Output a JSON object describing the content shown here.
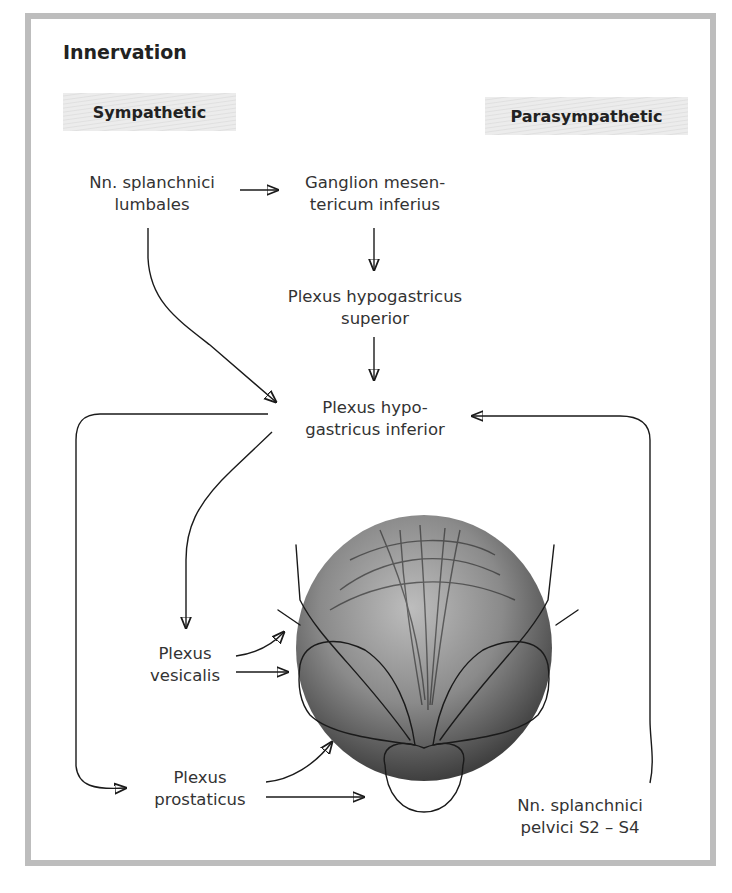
{
  "title": "Innervation",
  "columns": {
    "sympathetic": "Sympathetic",
    "parasympathetic": "Parasympathetic"
  },
  "nodes": {
    "nn_splanchnici_lumbales": [
      "Nn. splanchnici",
      "lumbales"
    ],
    "ganglion_mesentericum_inferius": [
      "Ganglion mesen-",
      "tericum inferius"
    ],
    "plexus_hypogastricus_superior": [
      "Plexus hypogastricus",
      "superior"
    ],
    "plexus_hypogastricus_inferior": [
      "Plexus hypo-",
      "gastricus inferior"
    ],
    "plexus_vesicalis": [
      "Plexus",
      "vesicalis"
    ],
    "plexus_prostaticus": [
      "Plexus",
      "prostaticus"
    ],
    "nn_splanchnici_pelvici": [
      "Nn. splanchnici",
      "pelvici S2 – S4"
    ]
  },
  "edges": [
    {
      "from": "nn_splanchnici_lumbales",
      "to": "ganglion_mesentericum_inferius"
    },
    {
      "from": "nn_splanchnici_lumbales",
      "to": "plexus_hypogastricus_inferior"
    },
    {
      "from": "ganglion_mesentericum_inferius",
      "to": "plexus_hypogastricus_superior"
    },
    {
      "from": "plexus_hypogastricus_superior",
      "to": "plexus_hypogastricus_inferior"
    },
    {
      "from": "nn_splanchnici_pelvici",
      "to": "plexus_hypogastricus_inferior"
    },
    {
      "from": "plexus_hypogastricus_inferior",
      "to": "plexus_vesicalis"
    },
    {
      "from": "plexus_hypogastricus_inferior",
      "to": "plexus_prostaticus"
    },
    {
      "from": "plexus_vesicalis",
      "to": "bladder-illustration"
    },
    {
      "from": "plexus_prostaticus",
      "to": "prostate-illustration"
    }
  ],
  "illustration": "urinary bladder with seminal vesicles, ductus deferentes and prostate (posterior view)",
  "colors": {
    "frame": "#bdbdbd",
    "tag_bg": "#e6e6e6",
    "text": "#333333",
    "arrow": "#1a1a1a"
  }
}
